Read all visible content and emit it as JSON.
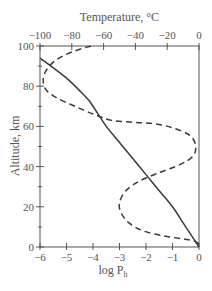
{
  "chart_data": {
    "type": "line",
    "title": "",
    "top_xlabel": "Temperature, °C",
    "bottom_xlabel": "log P",
    "bottom_xlabel_subscript": "h",
    "ylabel": "Altitude, km",
    "ylim": [
      0,
      100
    ],
    "bottom_xlim": [
      -6,
      0
    ],
    "top_xlim": [
      -100,
      0
    ],
    "grid": false,
    "legend": null,
    "y_ticks": [
      0,
      20,
      40,
      60,
      80,
      100
    ],
    "y_minor_ticks": [
      10,
      30,
      50,
      70,
      90
    ],
    "bottom_x_ticks": [
      -6,
      -5,
      -4,
      -3,
      -2,
      -1,
      0
    ],
    "bottom_x_tick_labels": [
      "−6",
      "−5",
      "−4",
      "−3",
      "−2",
      "−1",
      "0"
    ],
    "top_x_ticks": [
      -100,
      -80,
      -60,
      -40,
      -20,
      0
    ],
    "top_x_tick_labels": [
      "−100",
      "−80",
      "−60",
      "−40",
      "−20",
      "0"
    ],
    "series": [
      {
        "name": "log P_h (pressure)",
        "axis": "bottom",
        "style": "solid",
        "points": [
          {
            "x": -6.0,
            "y": 94
          },
          {
            "x": -5.0,
            "y": 84
          },
          {
            "x": -4.3,
            "y": 75
          },
          {
            "x": -4.1,
            "y": 72
          },
          {
            "x": -3.8,
            "y": 66
          },
          {
            "x": -3.5,
            "y": 60
          },
          {
            "x": -3.0,
            "y": 52
          },
          {
            "x": -2.5,
            "y": 44
          },
          {
            "x": -2.0,
            "y": 36
          },
          {
            "x": -1.5,
            "y": 28
          },
          {
            "x": -1.0,
            "y": 20
          },
          {
            "x": -0.6,
            "y": 12
          },
          {
            "x": -0.3,
            "y": 6
          },
          {
            "x": 0.0,
            "y": 0
          }
        ]
      },
      {
        "name": "Temperature",
        "axis": "top",
        "style": "dashed",
        "points": [
          {
            "x": -68,
            "y": 100
          },
          {
            "x": -80,
            "y": 97
          },
          {
            "x": -90,
            "y": 93
          },
          {
            "x": -96,
            "y": 88
          },
          {
            "x": -98,
            "y": 83
          },
          {
            "x": -96,
            "y": 78
          },
          {
            "x": -89,
            "y": 74
          },
          {
            "x": -78,
            "y": 70
          },
          {
            "x": -66,
            "y": 66
          },
          {
            "x": -55,
            "y": 63
          },
          {
            "x": -40,
            "y": 62
          },
          {
            "x": -25,
            "y": 61
          },
          {
            "x": -12,
            "y": 58
          },
          {
            "x": -5,
            "y": 55
          },
          {
            "x": -2,
            "y": 50
          },
          {
            "x": -4,
            "y": 45
          },
          {
            "x": -12,
            "y": 41
          },
          {
            "x": -25,
            "y": 37
          },
          {
            "x": -37,
            "y": 33
          },
          {
            "x": -46,
            "y": 28
          },
          {
            "x": -50,
            "y": 22
          },
          {
            "x": -49,
            "y": 17
          },
          {
            "x": -44,
            "y": 12
          },
          {
            "x": -35,
            "y": 8
          },
          {
            "x": -22,
            "y": 5.5
          },
          {
            "x": -10,
            "y": 4
          },
          {
            "x": -3,
            "y": 3
          },
          {
            "x": 0,
            "y": 1.5
          }
        ]
      }
    ]
  }
}
